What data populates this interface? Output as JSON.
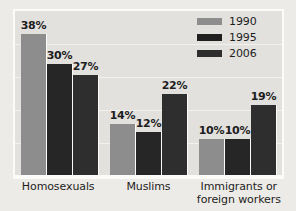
{
  "chart_data": {
    "type": "bar",
    "title": "",
    "subtitle": "",
    "xlabel": "",
    "ylabel": "",
    "ylim": [
      0,
      44
    ],
    "grid": true,
    "legend_position": "top-right",
    "categories": [
      "Homosexuals",
      "Muslims",
      "Immigrants or\nforeign workers"
    ],
    "series": [
      {
        "name": "1990",
        "color": "#8d8d8d",
        "values": [
          38,
          14,
          10
        ],
        "labels": [
          "38%",
          "14%",
          "10%"
        ]
      },
      {
        "name": "1995",
        "color": "#262626",
        "values": [
          30,
          12,
          10
        ],
        "labels": [
          "30%",
          "12%",
          "10%"
        ]
      },
      {
        "name": "2006",
        "color": "#2e2e2e",
        "values": [
          27,
          22,
          19
        ],
        "labels": [
          "27%",
          "12%",
          "19%"
        ]
      }
    ],
    "data_labels": [
      [
        "38%",
        "30%",
        "27%"
      ],
      [
        "14%",
        "12%",
        "22%"
      ],
      [
        "10%",
        "10%",
        "19%"
      ]
    ],
    "category_labels": [
      {
        "line1": "Homosexuals",
        "line2": ""
      },
      {
        "line1": "Muslims",
        "line2": ""
      },
      {
        "line1": "Immigrants or",
        "line2": "foreign workers"
      }
    ]
  },
  "legend": {
    "items": [
      {
        "label": "1990",
        "color": "#8d8d8d"
      },
      {
        "label": "1995",
        "color": "#1f1f1f"
      },
      {
        "label": "2006",
        "color": "#2e2e2e"
      }
    ]
  },
  "colors": {
    "plot_background": "#e3e1dd",
    "page_background": "#edebe7",
    "frame": "#fbfbfa",
    "gridline": "#f2f1ee",
    "text": "#1d1d1d",
    "series_1990": "#8d8d8d",
    "series_1995": "#262626",
    "series_2006": "#2e2e2e"
  }
}
